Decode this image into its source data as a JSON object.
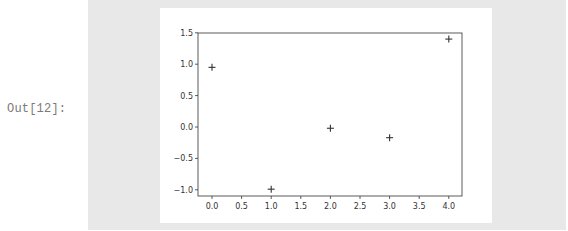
{
  "cell": {
    "prompt": "Out[12]:"
  },
  "colors": {
    "output_background": "#e8e8e8",
    "figure_background": "#ffffff",
    "axes_color": "#333333",
    "marker_color": "#333333"
  },
  "chart_data": {
    "type": "scatter",
    "title": "",
    "xlabel": "",
    "ylabel": "",
    "marker": "+",
    "x": [
      0,
      1,
      2,
      3,
      4
    ],
    "values": [
      0.95,
      -0.99,
      -0.02,
      -0.17,
      1.4
    ],
    "xlim": [
      -0.2,
      4.2
    ],
    "ylim": [
      -1.1,
      1.5
    ],
    "x_ticks": [
      "0.0",
      "0.5",
      "1.0",
      "1.5",
      "2.0",
      "2.5",
      "3.0",
      "3.5",
      "4.0"
    ],
    "y_ticks": [
      "1.5",
      "1.0",
      "0.5",
      "0.0",
      "−0.5",
      "−1.0"
    ],
    "grid": false,
    "legend": null
  }
}
